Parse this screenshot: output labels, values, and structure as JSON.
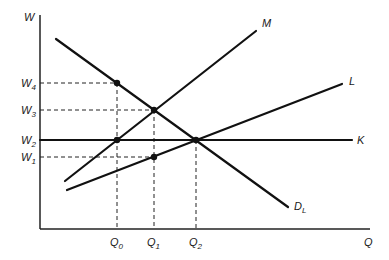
{
  "chart_data": {
    "type": "line",
    "title": "",
    "xlabel": "Q",
    "ylabel": "W",
    "axes": {
      "origin": [
        40,
        229
      ],
      "x_end": 370,
      "y_top": 15
    },
    "series": [
      {
        "name": "M",
        "label": "M",
        "points": [
          [
            65,
            181
          ],
          [
            256,
            31
          ]
        ],
        "label_pos": [
          262,
          27
        ]
      },
      {
        "name": "L",
        "label": "L",
        "points": [
          [
            67,
            190
          ],
          [
            342,
            84
          ]
        ],
        "label_pos": [
          349,
          85
        ]
      },
      {
        "name": "K",
        "label": "K",
        "points": [
          [
            40,
            140
          ],
          [
            352,
            140
          ]
        ],
        "label_pos": [
          357,
          144
        ]
      },
      {
        "name": "D_L",
        "label": "D",
        "label_sub": "L",
        "points": [
          [
            56,
            39
          ],
          [
            288,
            207
          ]
        ],
        "label_pos": [
          294,
          210
        ]
      }
    ],
    "y_ticks": [
      {
        "label": "W",
        "sub": "4",
        "y": 83
      },
      {
        "label": "W",
        "sub": "3",
        "y": 110
      },
      {
        "label": "W",
        "sub": "2",
        "y": 140
      },
      {
        "label": "W",
        "sub": "1",
        "y": 157
      }
    ],
    "x_ticks": [
      {
        "label": "Q",
        "sub": "0",
        "x": 117
      },
      {
        "label": "Q",
        "sub": "1",
        "x": 154
      },
      {
        "label": "Q",
        "sub": "2",
        "x": 196
      }
    ],
    "dashed_guides": [
      {
        "from": [
          40,
          83
        ],
        "to": [
          117,
          83
        ]
      },
      {
        "from": [
          40,
          110
        ],
        "to": [
          154,
          110
        ]
      },
      {
        "from": [
          40,
          157
        ],
        "to": [
          154,
          157
        ]
      },
      {
        "from": [
          117,
          83
        ],
        "to": [
          117,
          229
        ]
      },
      {
        "from": [
          154,
          110
        ],
        "to": [
          154,
          229
        ]
      },
      {
        "from": [
          196,
          140
        ],
        "to": [
          196,
          229
        ]
      }
    ],
    "points": [
      {
        "name": "Q0-W4",
        "x": 117,
        "y": 83
      },
      {
        "name": "Q1-W3",
        "x": 154,
        "y": 110
      },
      {
        "name": "Q0-W2",
        "x": 117,
        "y": 140
      },
      {
        "name": "Q2-W2",
        "x": 196,
        "y": 140
      },
      {
        "name": "Q1-W1",
        "x": 154,
        "y": 157
      }
    ],
    "grid": false,
    "legend": "none"
  }
}
